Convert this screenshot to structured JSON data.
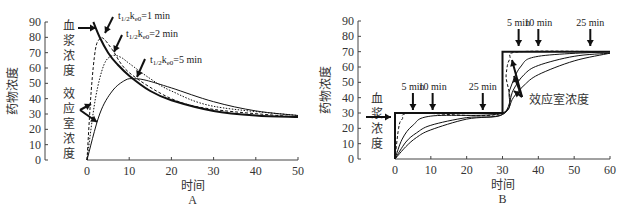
{
  "chart_data": [
    {
      "panel": "A",
      "type": "line",
      "title": "",
      "xlabel": "时间",
      "ylabel": "药物浓度",
      "panel_label": "A",
      "xlim": [
        0,
        50
      ],
      "ylim": [
        0,
        90
      ],
      "x_ticks": [
        "0",
        "10",
        "20",
        "30",
        "40",
        "50"
      ],
      "y_ticks": [
        "0",
        "10",
        "20",
        "30",
        "40",
        "50",
        "60",
        "70",
        "80",
        "90"
      ],
      "grid": false,
      "annotations": {
        "plasma": "血浆浓度",
        "effect_site": "效应室浓度",
        "k1": "t1/2ke0=1 min",
        "k2": "t1/2ke0=2 min",
        "k5": "t1/2ke0=5 min"
      },
      "series": [
        {
          "name": "血浆浓度",
          "x": [
            1.5,
            3,
            5,
            7,
            10,
            15,
            20,
            30,
            40,
            50
          ],
          "values": [
            90,
            80,
            70,
            63,
            55,
            45,
            39,
            32,
            29,
            28
          ]
        },
        {
          "name": "效应室浓度 t1/2ke0=1 min",
          "x": [
            0,
            1,
            2,
            3,
            4,
            6,
            10,
            20,
            30,
            50
          ],
          "values": [
            0,
            45,
            72,
            79,
            79,
            72,
            57,
            40,
            33,
            28
          ]
        },
        {
          "name": "效应室浓度 t1/2ke0=2 min",
          "x": [
            0,
            2,
            4,
            6,
            8,
            10,
            15,
            20,
            30,
            50
          ],
          "values": [
            0,
            40,
            62,
            68,
            67,
            63,
            53,
            45,
            35,
            29
          ]
        },
        {
          "name": "效应室浓度 t1/2ke0=5 min",
          "x": [
            0,
            3,
            6,
            9,
            11,
            14,
            20,
            30,
            40,
            50
          ],
          "values": [
            0,
            30,
            45,
            52,
            53,
            52,
            47,
            38,
            32,
            29
          ]
        }
      ]
    },
    {
      "panel": "B",
      "type": "line",
      "title": "",
      "xlabel": "时间",
      "ylabel": "药物浓度",
      "panel_label": "B",
      "xlim": [
        0,
        60
      ],
      "ylim": [
        0,
        90
      ],
      "x_ticks": [
        "0",
        "10",
        "20",
        "30",
        "40",
        "50",
        "60"
      ],
      "y_ticks": [
        "0",
        "10",
        "20",
        "30",
        "40",
        "50",
        "60",
        "70",
        "80",
        "90"
      ],
      "grid": false,
      "annotations": {
        "plasma": "血浆浓度",
        "effect_site": "效应室浓度",
        "arrows_low": [
          "5 min",
          "10 min",
          "25 min"
        ],
        "arrows_high": [
          "5 min",
          "10 min",
          "25 min"
        ]
      },
      "series": [
        {
          "name": "血浆浓度",
          "x": [
            0,
            0,
            30,
            30,
            60
          ],
          "values": [
            0,
            30,
            30,
            70,
            70
          ]
        },
        {
          "name": "效应室浓度 (fastest)",
          "x": [
            0,
            1,
            2,
            5,
            30,
            31,
            32,
            35,
            60
          ],
          "values": [
            0,
            20,
            26,
            30,
            30,
            55,
            65,
            70,
            70
          ]
        },
        {
          "name": "效应室浓度 5 min",
          "x": [
            0,
            2,
            5,
            10,
            30,
            32,
            35,
            40,
            60
          ],
          "values": [
            0,
            13,
            22,
            28,
            30,
            45,
            60,
            67,
            70
          ]
        },
        {
          "name": "效应室浓度 10 min",
          "x": [
            0,
            3,
            6,
            10,
            20,
            30,
            33,
            36,
            40,
            50,
            60
          ],
          "values": [
            0,
            11,
            17,
            22,
            27,
            29,
            45,
            55,
            61,
            67,
            69
          ]
        },
        {
          "name": "效应室浓度 25 min",
          "x": [
            0,
            3,
            6,
            10,
            20,
            30,
            33,
            36,
            40,
            50,
            60
          ],
          "values": [
            0,
            8,
            14,
            19,
            26,
            29,
            40,
            48,
            55,
            64,
            69
          ]
        }
      ]
    }
  ]
}
